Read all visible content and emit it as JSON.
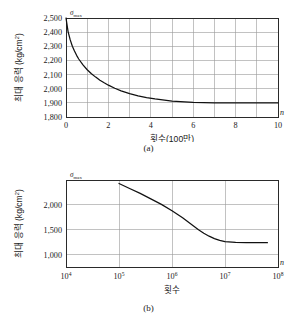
{
  "document": {
    "type": "textbook-figure",
    "background_color": "#ffffff",
    "ink_color": "#1a1a1a",
    "grid_color": "#9a9a9a"
  },
  "figures": [
    {
      "id": "a",
      "caption": "(a)",
      "sigma_symbol": "σ",
      "sigma_subscript": "max",
      "n_symbol": "n"
    },
    {
      "id": "b",
      "caption": "(b)",
      "sigma_symbol": "σ",
      "sigma_subscript": "max",
      "n_symbol": "n"
    }
  ],
  "chart_data": [
    {
      "type": "line",
      "id": "chart-a",
      "title": "",
      "xlabel": "횟수(100만)",
      "ylabel": "최대 응력 (kg/cm²)",
      "ylabel_main": "최대 응력 (kg/cm",
      "ylabel_sup": "2",
      "ylabel_tail": ")",
      "axis_symbol_y": "σmax",
      "axis_symbol_x": "n",
      "xlim": [
        0,
        10
      ],
      "ylim": [
        1800,
        2500
      ],
      "grid": true,
      "grid_x_step": 1,
      "grid_y_step": 100,
      "legend": "none",
      "xticks": [
        0,
        2,
        4,
        6,
        8,
        10
      ],
      "xticklabels": [
        "0",
        "2",
        "4",
        "6",
        "8",
        "10"
      ],
      "yticks": [
        1800,
        1900,
        2000,
        2100,
        2200,
        2300,
        2400,
        2500
      ],
      "yticklabels": [
        "1,800",
        "1,900",
        "2,000",
        "2,100",
        "2,200",
        "2,300",
        "2,400",
        "2,500"
      ],
      "x": [
        0.0,
        0.1,
        0.2,
        0.3,
        0.4,
        0.5,
        0.6,
        0.8,
        1.0,
        1.2,
        1.4,
        1.6,
        1.8,
        2.0,
        2.3,
        2.6,
        3.0,
        3.4,
        3.8,
        4.2,
        5.0,
        6.0,
        7.0,
        8.0,
        9.0,
        10.0
      ],
      "values": [
        2500,
        2402,
        2345,
        2300,
        2266,
        2236,
        2210,
        2168,
        2134,
        2106,
        2082,
        2060,
        2042,
        2025,
        2003,
        1985,
        1965,
        1949,
        1937,
        1928,
        1913,
        1903,
        1900,
        1900,
        1900,
        1900
      ],
      "asymptote": 1900,
      "start_value": 2500
    },
    {
      "type": "line",
      "id": "chart-b",
      "title": "",
      "xlabel": "횟수",
      "ylabel": "최대 응력 (kg/cm²)",
      "ylabel_main": "최대 응력 (kg/cm",
      "ylabel_sup": "2",
      "ylabel_tail": ")",
      "axis_symbol_y": "σmax",
      "axis_symbol_x": "n",
      "xscale": "log",
      "xlim": [
        10000,
        100000000
      ],
      "ylim": [
        750,
        2500
      ],
      "grid": true,
      "legend": "none",
      "xticks": [
        4,
        5,
        6,
        7,
        8
      ],
      "xticklabels": [
        "10⁴",
        "10⁵",
        "10⁶",
        "10⁷",
        "10⁸"
      ],
      "xtick_bases": [
        "10",
        "10",
        "10",
        "10",
        "10"
      ],
      "xtick_exponents": [
        "4",
        "5",
        "6",
        "7",
        "8"
      ],
      "yticks": [
        1000,
        1500,
        2000
      ],
      "yticklabels": [
        "1,000",
        "1,500",
        "2,000"
      ],
      "x_log": [
        5.0,
        5.2,
        5.4,
        5.6,
        5.8,
        6.0,
        6.1,
        6.2,
        6.3,
        6.4,
        6.5,
        6.6,
        6.7,
        6.8,
        6.9,
        7.0,
        7.2,
        7.4,
        7.6,
        7.8
      ],
      "values": [
        2430,
        2330,
        2230,
        2120,
        2010,
        1880,
        1810,
        1740,
        1660,
        1580,
        1500,
        1430,
        1370,
        1320,
        1285,
        1260,
        1243,
        1238,
        1238,
        1238
      ],
      "asymptote": 1240,
      "start_value": 2430,
      "curve_start_decade": 5,
      "curve_end_decade": 7.8
    }
  ]
}
